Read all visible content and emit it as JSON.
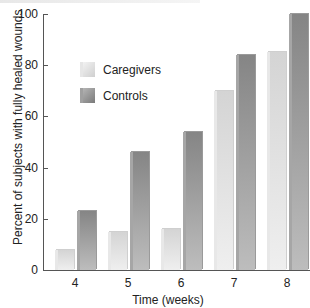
{
  "chart_data": {
    "type": "bar",
    "title": "",
    "xlabel": "Time (weeks)",
    "ylabel": "Percent of subjects with fully healed wounds",
    "ylim": [
      0,
      100
    ],
    "yticks": [
      0,
      20,
      40,
      60,
      80,
      100
    ],
    "categories": [
      "4",
      "5",
      "6",
      "7",
      "8"
    ],
    "series": [
      {
        "name": "Caregivers",
        "values": [
          8,
          15,
          16,
          70,
          85
        ],
        "color": "#e0e0e0"
      },
      {
        "name": "Controls",
        "values": [
          23,
          46,
          54,
          84,
          100
        ],
        "color": "#9a9a9a"
      }
    ],
    "legend_position": "upper-left",
    "grid": false
  },
  "labels": {
    "yticks": [
      "0",
      "20",
      "40",
      "60",
      "80",
      "100"
    ],
    "xticks": [
      "4",
      "5",
      "6",
      "7",
      "8"
    ],
    "xlabel": "Time (weeks)",
    "ylabel": "Percent of subjects with fully healed wounds",
    "legend": [
      "Caregivers",
      "Controls"
    ]
  }
}
